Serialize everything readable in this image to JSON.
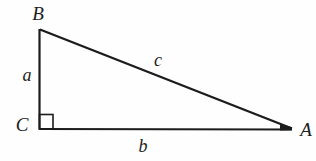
{
  "figure": {
    "type": "right-triangle",
    "vertex_labels": {
      "top": "B",
      "bottom_left": "C",
      "bottom_right": "A"
    },
    "side_labels": {
      "left_leg": "a",
      "base": "b",
      "hypotenuse": "c"
    },
    "right_angle_at": "C"
  },
  "colors": {
    "line": "#1c1c1c",
    "background": "#fefefe"
  }
}
